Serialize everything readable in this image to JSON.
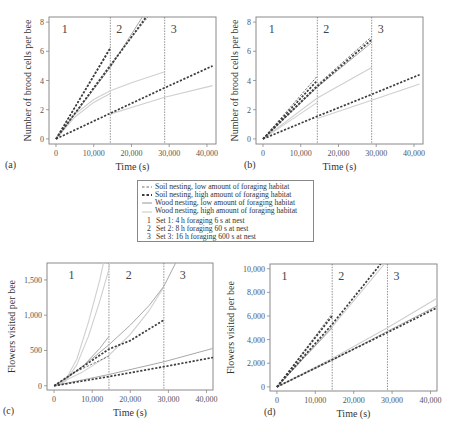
{
  "colors": {
    "soil_low": "#6e6e6e",
    "soil_high": "#3c3c3c",
    "wood_low": "#a8a8a8",
    "wood_high": "#cfcfcf",
    "frame": "#8a8a8a",
    "divider": "#777777"
  },
  "legend": {
    "series": [
      {
        "key": "soil_low",
        "style": "dash-light",
        "label": "Soil nesting, low amount of foraging habitat"
      },
      {
        "key": "soil_high",
        "style": "dash-heavy",
        "label": "Soil nesting, high amount of foraging habitat"
      },
      {
        "key": "wood_low",
        "style": "solid-dark",
        "label": "Wood nesting, low amount of foraging habitat"
      },
      {
        "key": "wood_high",
        "style": "solid-light",
        "label": "Wood nesting, high amount of foraging habitat"
      }
    ],
    "sets": [
      {
        "num": "1",
        "label": "Set 1: 4 h foraging 6 s at nest"
      },
      {
        "num": "2",
        "label": "Set 2: 8 h foraging 60 s at nest"
      },
      {
        "num": "3",
        "label": "Set 3: 16 h foraging 600 s at nest"
      }
    ]
  },
  "chart_data": [
    {
      "id": "a",
      "panel_label": "(a)",
      "type": "line",
      "title": "",
      "xlabel": "Time (s)",
      "ylabel": "Number of brood cells per bee",
      "xlim": [
        -1850,
        42400
      ],
      "ylim": [
        -0.35,
        8.35
      ],
      "xticks": [
        0,
        10000,
        20000,
        30000,
        40000
      ],
      "xtick_labels": [
        "0",
        "10,000",
        "20,000",
        "30,000",
        "40,000"
      ],
      "yticks": [
        0,
        2,
        4,
        6,
        8
      ],
      "ytick_labels": [
        "0",
        "2",
        "4",
        "6",
        "8"
      ],
      "dividers": [
        14400,
        28800
      ],
      "regions": [
        {
          "label": "1",
          "x": 1500
        },
        {
          "label": "2",
          "x": 16000
        },
        {
          "label": "3",
          "x": 30400
        }
      ],
      "grid": false,
      "series": [
        {
          "name": "Soil nesting, low amount of foraging habitat",
          "key": "soil_low",
          "style": "dash-light",
          "x": [
            0,
            14400
          ],
          "y": [
            0,
            6.3
          ]
        },
        {
          "name": "Soil nesting, high amount of foraging habitat",
          "key": "soil_high",
          "style": "dash-heavy",
          "x": [
            0,
            14400
          ],
          "y": [
            0,
            6.2
          ]
        },
        {
          "name": "Soil nesting, low amount of foraging habitat (set 2)",
          "key": "soil_low",
          "style": "dash-light",
          "x": [
            0,
            14400,
            24500
          ],
          "y": [
            0,
            5.1,
            8.4
          ]
        },
        {
          "name": "Soil nesting, high amount of foraging habitat (set 2)",
          "key": "soil_high",
          "style": "dash-heavy",
          "x": [
            0,
            14400,
            24000
          ],
          "y": [
            0,
            5.0,
            8.4
          ]
        },
        {
          "name": "Wood nesting, low amount of foraging habitat (set 2)",
          "key": "wood_low",
          "style": "solid-dark",
          "x": [
            0,
            14400,
            23000
          ],
          "y": [
            0,
            4.9,
            8.4
          ]
        },
        {
          "name": "Soil nesting (set 3)",
          "key": "soil_high",
          "style": "dash-heavy",
          "x": [
            0,
            14400,
            28800,
            41500
          ],
          "y": [
            0,
            1.75,
            3.5,
            5.0
          ]
        },
        {
          "name": "Wood nesting, high amount of foraging habitat (set 1)",
          "key": "wood_high",
          "style": "solid-light",
          "x": [
            0,
            5000,
            10000,
            14400,
            20000,
            28800
          ],
          "y": [
            0,
            1.7,
            2.7,
            3.3,
            3.85,
            4.6
          ]
        },
        {
          "name": "Wood nesting, low amount of foraging habitat (set 1)",
          "key": "wood_high",
          "style": "solid-light",
          "x": [
            0,
            5000,
            10000,
            14400
          ],
          "y": [
            0,
            1.5,
            2.5,
            3.1
          ]
        },
        {
          "name": "Wood nesting (set 3)",
          "key": "wood_high",
          "style": "solid-light",
          "x": [
            14400,
            20000,
            28800,
            41500
          ],
          "y": [
            1.7,
            2.15,
            2.85,
            3.65
          ]
        }
      ]
    },
    {
      "id": "b",
      "panel_label": "(b)",
      "type": "line",
      "title": "",
      "xlabel": "Time (s)",
      "ylabel": "Number of brood cells per bee",
      "xlim": [
        -1850,
        42400
      ],
      "ylim": [
        -0.35,
        8.35
      ],
      "xticks": [
        0,
        10000,
        20000,
        30000,
        40000
      ],
      "xtick_labels": [
        "0",
        "10,000",
        "20,000",
        "30,000",
        "40,000"
      ],
      "yticks": [
        0,
        2,
        4,
        6,
        8
      ],
      "ytick_labels": [
        "0",
        "2",
        "4",
        "6",
        "8"
      ],
      "dividers": [
        14400,
        28800
      ],
      "regions": [
        {
          "label": "1",
          "x": 1500
        },
        {
          "label": "2",
          "x": 16000
        },
        {
          "label": "3",
          "x": 30400
        }
      ],
      "grid": false,
      "series": [
        {
          "name": "Soil nesting, low amount of foraging habitat (set 1)",
          "key": "soil_low",
          "style": "dash-light",
          "x": [
            0,
            14400
          ],
          "y": [
            0,
            4.3
          ]
        },
        {
          "name": "Soil nesting, high amount of foraging habitat (set 1)",
          "key": "soil_high",
          "style": "dash-heavy",
          "x": [
            0,
            14400
          ],
          "y": [
            0,
            4.0
          ]
        },
        {
          "name": "Soil nesting, low amount of foraging habitat (set 2)",
          "key": "soil_low",
          "style": "dash-light",
          "x": [
            0,
            14400,
            28800
          ],
          "y": [
            0,
            3.7,
            7.0
          ]
        },
        {
          "name": "Soil nesting, high amount of foraging habitat (set 2)",
          "key": "soil_high",
          "style": "dash-heavy",
          "x": [
            0,
            14400,
            28800
          ],
          "y": [
            0,
            3.6,
            6.8
          ]
        },
        {
          "name": "Wood nesting, low amount of foraging habitat (set 2)",
          "key": "wood_low",
          "style": "solid-dark",
          "x": [
            0,
            14400,
            28800
          ],
          "y": [
            0,
            3.55,
            6.6
          ]
        },
        {
          "name": "Wood nesting, high amount of foraging habitat (set 1-2)",
          "key": "wood_high",
          "style": "solid-light",
          "x": [
            0,
            14400,
            28800
          ],
          "y": [
            0,
            2.8,
            4.9
          ]
        },
        {
          "name": "Wood nesting (set 1)",
          "key": "wood_high",
          "style": "solid-light",
          "x": [
            0,
            14400
          ],
          "y": [
            0,
            2.5
          ]
        },
        {
          "name": "Soil nesting (set 3)",
          "key": "soil_high",
          "style": "dash-heavy",
          "x": [
            0,
            14400,
            28800,
            41500
          ],
          "y": [
            0,
            1.55,
            3.05,
            4.4
          ]
        },
        {
          "name": "Wood nesting (set 3)",
          "key": "wood_high",
          "style": "solid-light",
          "x": [
            14400,
            28800,
            41500
          ],
          "y": [
            1.4,
            2.65,
            3.75
          ]
        }
      ]
    },
    {
      "id": "c",
      "panel_label": "(c)",
      "type": "line",
      "title": "",
      "xlabel": "Time (s)",
      "ylabel": "Flowers visited per bee",
      "xlim": [
        -1850,
        41700
      ],
      "ylim": [
        -60,
        1740
      ],
      "xticks": [
        0,
        10000,
        20000,
        30000,
        40000
      ],
      "xtick_labels": [
        "0",
        "10,000",
        "20,000",
        "30,000",
        "40,000"
      ],
      "yticks": [
        0,
        500,
        1000,
        1500
      ],
      "ytick_labels": [
        "0",
        "500",
        "1,000",
        "1,500"
      ],
      "dividers": [
        14400,
        28800
      ],
      "regions": [
        {
          "label": "1",
          "x": 3800
        },
        {
          "label": "2",
          "x": 18800
        },
        {
          "label": "3",
          "x": 33000
        }
      ],
      "grid": false,
      "series": [
        {
          "name": "Wood nesting, high amount of foraging habitat (set 1a)",
          "key": "wood_high",
          "style": "solid-light",
          "x": [
            0,
            3000,
            6000,
            9000,
            12000,
            13000
          ],
          "y": [
            0,
            80,
            380,
            900,
            1500,
            1750
          ]
        },
        {
          "name": "Wood nesting, high amount of foraging habitat (set 1b)",
          "key": "wood_high",
          "style": "solid-light",
          "x": [
            0,
            3000,
            6000,
            9000,
            12000,
            14400,
            14600
          ],
          "y": [
            0,
            60,
            300,
            700,
            1200,
            1650,
            1750
          ]
        },
        {
          "name": "Wood nesting, low amount of foraging habitat (set 1)",
          "key": "wood_low",
          "style": "solid-dark",
          "x": [
            0,
            4000,
            8000,
            12000,
            14400
          ],
          "y": [
            0,
            130,
            300,
            530,
            700
          ]
        },
        {
          "name": "Wood nesting, low amount of foraging habitat (set 2)",
          "key": "wood_low",
          "style": "solid-dark",
          "x": [
            0,
            7000,
            14400,
            20000,
            25000,
            28800,
            32000
          ],
          "y": [
            0,
            250,
            580,
            860,
            1140,
            1410,
            1750
          ]
        },
        {
          "name": "Wood nesting, high amount of foraging habitat (set 2)",
          "key": "wood_high",
          "style": "solid-light",
          "x": [
            0,
            7000,
            14400,
            20000,
            25000,
            28800
          ],
          "y": [
            0,
            180,
            430,
            730,
            1070,
            1400
          ]
        },
        {
          "name": "Soil nesting, high amount of foraging habitat (set 1-2)",
          "key": "soil_high",
          "style": "dash-heavy",
          "x": [
            0,
            7000,
            14400,
            20000,
            28800
          ],
          "y": [
            0,
            250,
            520,
            640,
            930
          ]
        },
        {
          "name": "Soil nesting, low amount of foraging habitat (set 1-2)",
          "key": "soil_low",
          "style": "dash-light",
          "x": [
            0,
            5000,
            14400
          ],
          "y": [
            0,
            180,
            420
          ]
        },
        {
          "name": "Wood nesting, low amount of foraging habitat (set 3)",
          "key": "wood_low",
          "style": "solid-dark",
          "x": [
            0,
            14400,
            28800,
            41700
          ],
          "y": [
            0,
            160,
            340,
            530
          ]
        },
        {
          "name": "Soil nesting (set 3)",
          "key": "soil_high",
          "style": "dash-heavy",
          "x": [
            0,
            14400,
            28800,
            41700
          ],
          "y": [
            0,
            130,
            270,
            400
          ]
        }
      ]
    },
    {
      "id": "d",
      "panel_label": "(d)",
      "type": "line",
      "title": "",
      "xlabel": "Time (s)",
      "ylabel": "Flowers visited per bee",
      "xlim": [
        -1800,
        41700
      ],
      "ylim": [
        -350,
        10400
      ],
      "xticks": [
        0,
        10000,
        20000,
        30000,
        40000
      ],
      "xtick_labels": [
        "0",
        "10,000",
        "20,000",
        "30,000",
        "40,000"
      ],
      "yticks": [
        0,
        2000,
        4000,
        6000,
        8000,
        10000
      ],
      "ytick_labels": [
        "0",
        "2,000",
        "4,000",
        "6,000",
        "8,000",
        "10,000"
      ],
      "dividers": [
        14400,
        28800
      ],
      "regions": [
        {
          "label": "1",
          "x": 1200
        },
        {
          "label": "2",
          "x": 16000
        },
        {
          "label": "3",
          "x": 30400
        }
      ],
      "grid": false,
      "series": [
        {
          "name": "Soil nesting, low amount of foraging habitat (set 1)",
          "key": "soil_low",
          "style": "dash-light",
          "x": [
            0,
            14400
          ],
          "y": [
            0,
            6200
          ]
        },
        {
          "name": "Soil nesting, high amount of foraging habitat (set 1)",
          "key": "soil_high",
          "style": "dash-heavy",
          "x": [
            0,
            14400
          ],
          "y": [
            0,
            6000
          ]
        },
        {
          "name": "Soil nesting, high amount of foraging habitat (set 2)",
          "key": "soil_high",
          "style": "dash-heavy",
          "x": [
            0,
            14400,
            27000
          ],
          "y": [
            0,
            5300,
            10400
          ]
        },
        {
          "name": "Wood nesting, high amount of foraging habitat (set 2)",
          "key": "wood_high",
          "style": "solid-light",
          "x": [
            0,
            14400,
            28000
          ],
          "y": [
            0,
            5100,
            10400
          ]
        },
        {
          "name": "Wood nesting, low amount of foraging habitat (set 1-2)",
          "key": "wood_low",
          "style": "solid-dark",
          "x": [
            0,
            14400
          ],
          "y": [
            0,
            5000
          ]
        },
        {
          "name": "Wood nesting, high amount of foraging habitat (set 3)",
          "key": "wood_high",
          "style": "solid-light",
          "x": [
            0,
            14400,
            28800,
            41700
          ],
          "y": [
            0,
            2400,
            5000,
            7500
          ]
        },
        {
          "name": "Soil nesting (set 3)",
          "key": "soil_high",
          "style": "dash-heavy",
          "x": [
            0,
            14400,
            28800,
            41700
          ],
          "y": [
            0,
            2300,
            4600,
            6700
          ]
        },
        {
          "name": "Wood nesting, low amount of foraging habitat (set 3)",
          "key": "wood_low",
          "style": "solid-dark",
          "x": [
            0,
            14400,
            28800,
            41700
          ],
          "y": [
            0,
            2250,
            4700,
            6850
          ]
        }
      ]
    }
  ]
}
